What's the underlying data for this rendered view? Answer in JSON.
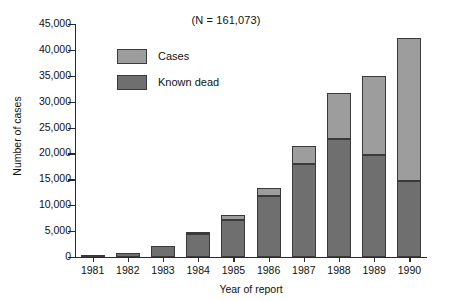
{
  "chart_data": {
    "type": "bar",
    "subtype": "stacked-vertical",
    "title": "(N = 161,073)",
    "xlabel": "Year of report",
    "ylabel": "Number of cases",
    "categories": [
      "1981",
      "1982",
      "1983",
      "1984",
      "1985",
      "1986",
      "1987",
      "1988",
      "1989",
      "1990"
    ],
    "series": [
      {
        "name": "Known dead",
        "color": "#6f6f6f",
        "values": [
          300,
          700,
          2100,
          4400,
          7100,
          11800,
          18000,
          22800,
          19700,
          14700
        ]
      },
      {
        "name": "Cases",
        "color": "#9d9d9d",
        "values": [
          0,
          0,
          0,
          100,
          1000,
          1500,
          3500,
          8900,
          15300,
          27600
        ]
      }
    ],
    "totals": [
      300,
      700,
      2100,
      4500,
      8100,
      13300,
      21500,
      31700,
      35000,
      42300
    ],
    "ylim": [
      0,
      45000
    ],
    "yticks": [
      0,
      5000,
      10000,
      15000,
      20000,
      25000,
      30000,
      35000,
      40000,
      45000
    ],
    "ytick_labels": [
      "0",
      "5,000",
      "10,000",
      "15,000",
      "20,000",
      "25,000",
      "30,000",
      "35,000",
      "40,000",
      "45,000"
    ],
    "grid": false,
    "legend_position": "upper-left-inside",
    "legend": [
      {
        "label": "Cases",
        "color": "#9d9d9d"
      },
      {
        "label": "Known dead",
        "color": "#6f6f6f"
      }
    ],
    "stack_order": [
      "Known dead",
      "Cases"
    ]
  }
}
